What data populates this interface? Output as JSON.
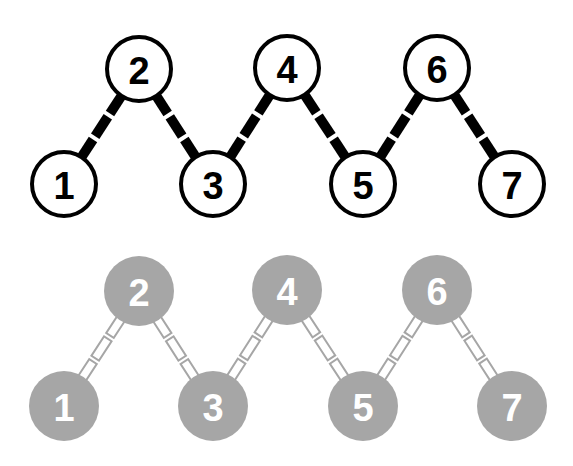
{
  "diagram": {
    "colors": {
      "outline_stroke": "#000000",
      "outline_fill": "#ffffff",
      "outline_text": "#000000",
      "filled_fill": "#a6a6a6",
      "filled_text": "#ffffff",
      "filled_bond": "#a6a6a6",
      "background": "#ffffff"
    },
    "top_chain": {
      "style": "outlined",
      "nodes": [
        {
          "label": "1",
          "cx": 64,
          "cy": 184
        },
        {
          "label": "2",
          "cx": 139,
          "cy": 69
        },
        {
          "label": "3",
          "cx": 213,
          "cy": 184
        },
        {
          "label": "4",
          "cx": 287,
          "cy": 68
        },
        {
          "label": "5",
          "cx": 363,
          "cy": 184
        },
        {
          "label": "6",
          "cx": 437,
          "cy": 68
        },
        {
          "label": "7",
          "cx": 512,
          "cy": 184
        }
      ]
    },
    "bottom_chain": {
      "style": "filled",
      "nodes": [
        {
          "label": "1",
          "cx": 64,
          "cy": 406
        },
        {
          "label": "2",
          "cx": 139,
          "cy": 291
        },
        {
          "label": "3",
          "cx": 213,
          "cy": 406
        },
        {
          "label": "4",
          "cx": 287,
          "cy": 290
        },
        {
          "label": "5",
          "cx": 363,
          "cy": 406
        },
        {
          "label": "6",
          "cx": 437,
          "cy": 290
        },
        {
          "label": "7",
          "cx": 512,
          "cy": 406
        }
      ]
    },
    "node_radius": 34,
    "bond_segments": 3
  }
}
